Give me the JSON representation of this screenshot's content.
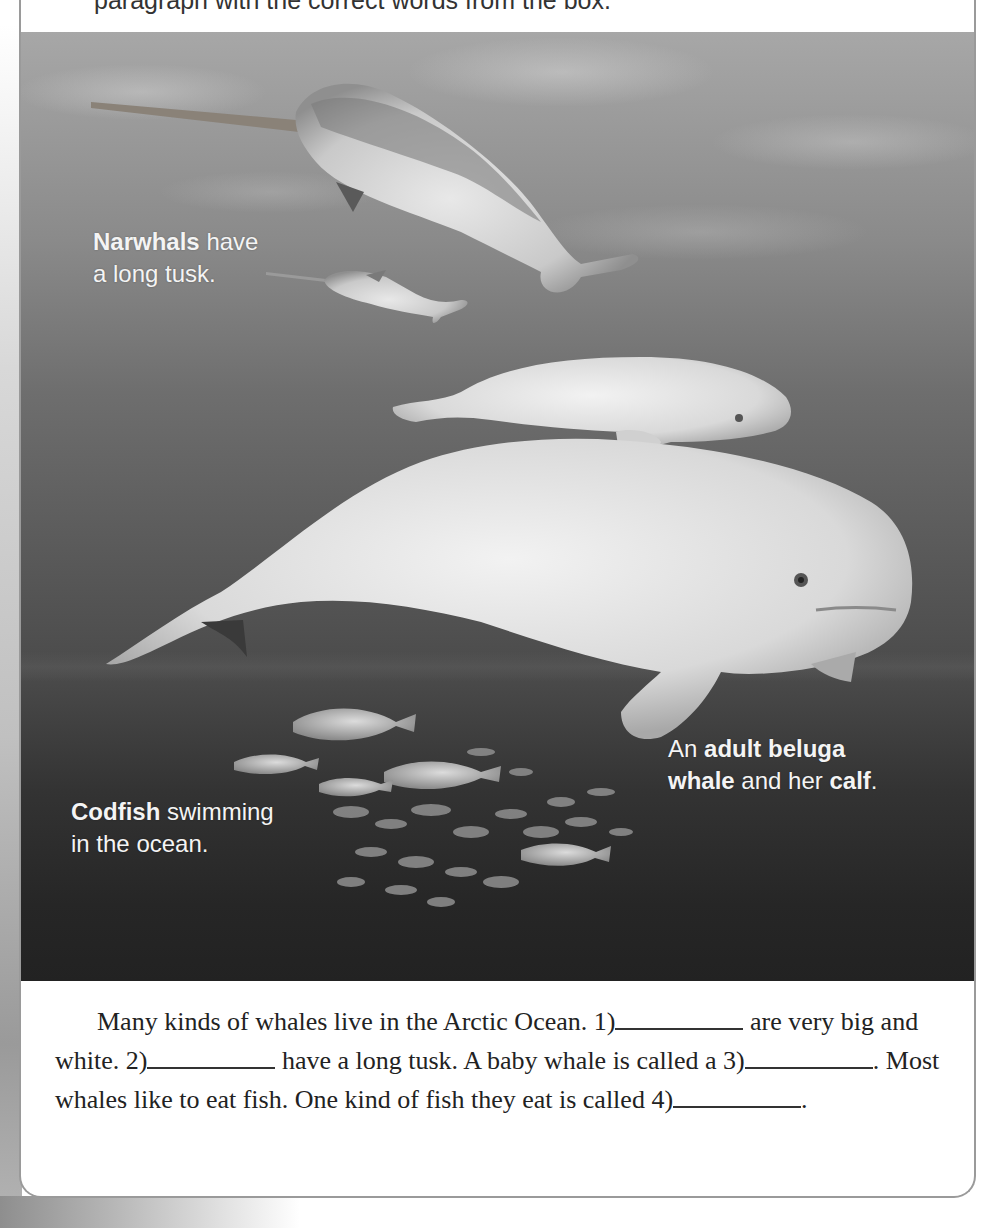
{
  "instruction": "paragraph with the correct words from the box.",
  "photo": {
    "captions": {
      "narwhal": {
        "bold": "Narwhals",
        "rest_line1": " have",
        "line2": "a long tusk."
      },
      "beluga": {
        "prefix": "An ",
        "bold1": "adult beluga",
        "bold2": "whale",
        "middle": " and her ",
        "bold3": "calf",
        "suffix": "."
      },
      "codfish": {
        "bold": "Codfish",
        "rest_line1": " swimming",
        "line2": "in the ocean."
      }
    },
    "icons": [
      "narwhal-illustration",
      "narwhal-calf-illustration",
      "beluga-calf-illustration",
      "beluga-adult-illustration",
      "codfish-school-illustration"
    ]
  },
  "paragraph": {
    "s1": "Many kinds of whales live in the Arctic Ocean. ",
    "b1": "1)",
    "s2": " are very big and white. ",
    "b2": "2)",
    "s3": " have a long tusk. A baby whale is called a ",
    "b3": "3)",
    "s4": ". Most whales like to eat fish. One kind of fish they eat is called ",
    "b4": "4)",
    "s5": "."
  },
  "colors": {
    "border": "#9a9a9a",
    "text": "#222222",
    "caption": "#f4f4f4"
  }
}
